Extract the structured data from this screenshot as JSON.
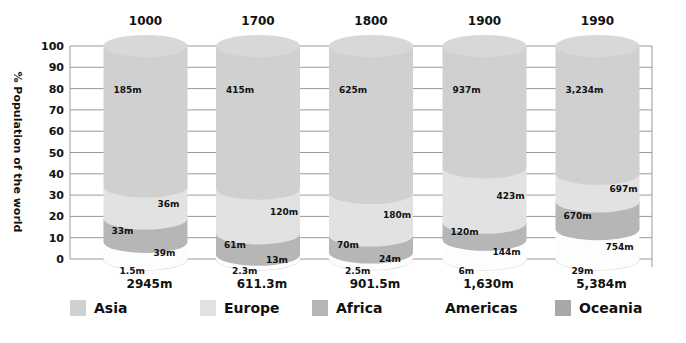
{
  "chart_data": {
    "type": "bar",
    "subtype": "stacked-100-percent-cylinders",
    "title": "",
    "ylabel": "% Population of the world",
    "xlabel": "",
    "ylim": [
      0,
      100
    ],
    "yticks": [
      0,
      10,
      20,
      30,
      40,
      50,
      60,
      70,
      80,
      90,
      100
    ],
    "grid": true,
    "categories": [
      "1000",
      "1700",
      "1800",
      "1900",
      "1990"
    ],
    "totals": [
      "2945m",
      "611.3m",
      "901.5m",
      "1,630m",
      "5,384m"
    ],
    "series": [
      {
        "name": "Asia",
        "color": "#d0d0d0",
        "labels": [
          "185m",
          "415m",
          "625m",
          "937m",
          "3,234m"
        ]
      },
      {
        "name": "Europe",
        "color": "#e2e2e2",
        "labels": [
          "36m",
          "120m",
          "180m",
          "423m",
          "697m"
        ]
      },
      {
        "name": "Africa",
        "color": "#b6b6b6",
        "labels": [
          "33m",
          "61m",
          "70m",
          "120m",
          "670m"
        ]
      },
      {
        "name": "Americas",
        "color": "#ffffff",
        "labels": [
          "39m",
          "13m",
          "24m",
          "144m",
          "754m"
        ]
      },
      {
        "name": "Oceania",
        "color": "#a8a8a8",
        "labels": [
          "1.5m",
          "2.3m",
          "2.5m",
          "6m",
          "29m"
        ]
      }
    ],
    "segment_tops_percent": [
      {
        "americas": 8,
        "africa": 19,
        "europe": 34
      },
      {
        "americas": 2,
        "africa": 12,
        "europe": 33
      },
      {
        "americas": 3,
        "africa": 11,
        "europe": 31
      },
      {
        "americas": 9,
        "africa": 17,
        "europe": 43
      },
      {
        "americas": 14,
        "africa": 27,
        "europe": 40
      }
    ],
    "legend_position": "bottom"
  },
  "legend": [
    {
      "label": "Asia",
      "color": "#d0d0d0"
    },
    {
      "label": "Europe",
      "color": "#e2e2e2"
    },
    {
      "label": "Africa",
      "color": "#b6b6b6"
    },
    {
      "label": "Americas",
      "color": ""
    },
    {
      "label": "Oceania",
      "color": "#a8a8a8"
    }
  ]
}
